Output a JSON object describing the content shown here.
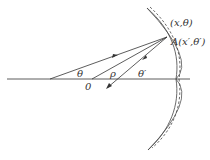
{
  "diagram": {
    "labels": {
      "point_polar": "(x,θ)",
      "point_A": "A(x′,θ′)",
      "angle_theta": "θ",
      "angle_theta_prime": "θ′",
      "rho": "ρ",
      "origin": "0"
    },
    "colors": {
      "line": "#333333",
      "background": "#ffffff"
    }
  }
}
